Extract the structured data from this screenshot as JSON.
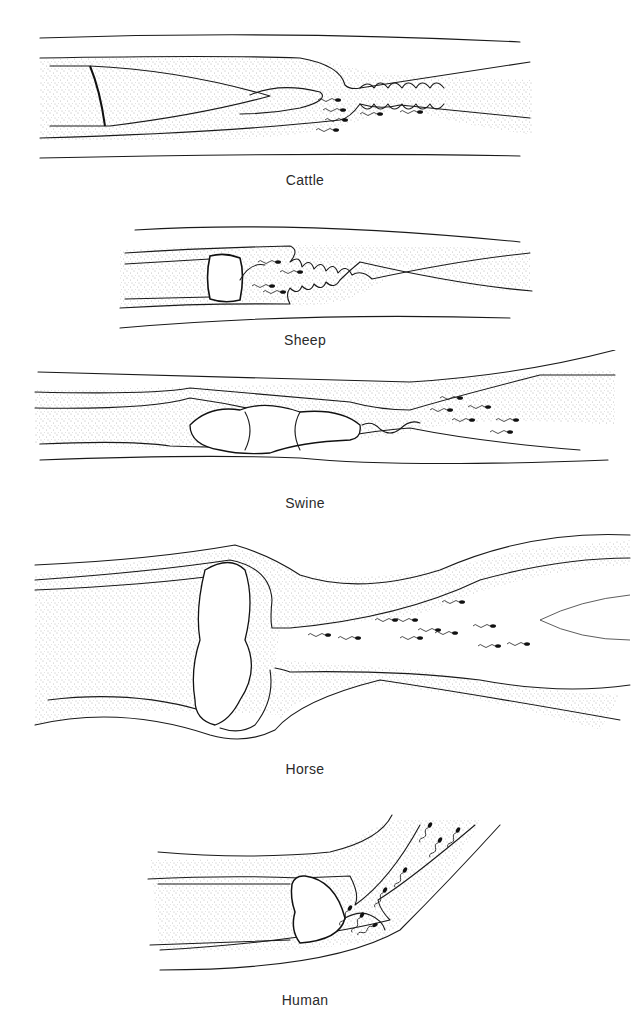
{
  "figure": {
    "panels": [
      {
        "id": "cattle",
        "label": "Cattle"
      },
      {
        "id": "sheep",
        "label": "Sheep"
      },
      {
        "id": "swine",
        "label": "Swine"
      },
      {
        "id": "horse",
        "label": "Horse"
      },
      {
        "id": "human",
        "label": "Human"
      }
    ]
  },
  "colors": {
    "line": "#1a1a1a",
    "stipple": "#555555",
    "background": "#ffffff",
    "label": "#2a2a2a"
  }
}
